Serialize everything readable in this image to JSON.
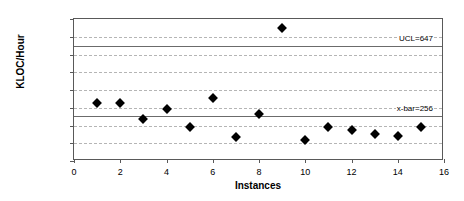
{
  "chart_data": {
    "type": "scatter",
    "title": "",
    "xlabel": "Instances",
    "ylabel": "KLOC/Hour",
    "xlim": [
      0,
      16
    ],
    "ylim": [
      0,
      800
    ],
    "grid": true,
    "legend": "none",
    "x_ticks": [
      "0",
      "2",
      "4",
      "6",
      "8",
      "10",
      "12",
      "14",
      "16"
    ],
    "x_tick_values": [
      0,
      2,
      4,
      6,
      8,
      10,
      12,
      14,
      16
    ],
    "y_ticks": [
      "0.0",
      "100.0",
      "200.0",
      "300.0",
      "400.0",
      "500.0",
      "600.0",
      "700.0",
      "800.0"
    ],
    "y_tick_values": [
      0,
      100,
      200,
      300,
      400,
      500,
      600,
      700,
      800
    ],
    "x": [
      1,
      2,
      3,
      4,
      5,
      6,
      7,
      8,
      9,
      10,
      11,
      12,
      13,
      14,
      15
    ],
    "values": [
      328,
      328,
      238,
      293,
      192,
      355,
      135,
      263,
      750,
      118,
      192,
      173,
      153,
      140,
      192
    ],
    "marker": "diamond",
    "marker_color": "#000000",
    "annotations": [
      {
        "name": "ucl",
        "label": "UCL=647",
        "value": 647,
        "line_color": "#6b6b6b"
      },
      {
        "name": "x-bar",
        "label": "x-bar=256",
        "value": 256,
        "line_color": "#6b6b6b"
      }
    ]
  }
}
